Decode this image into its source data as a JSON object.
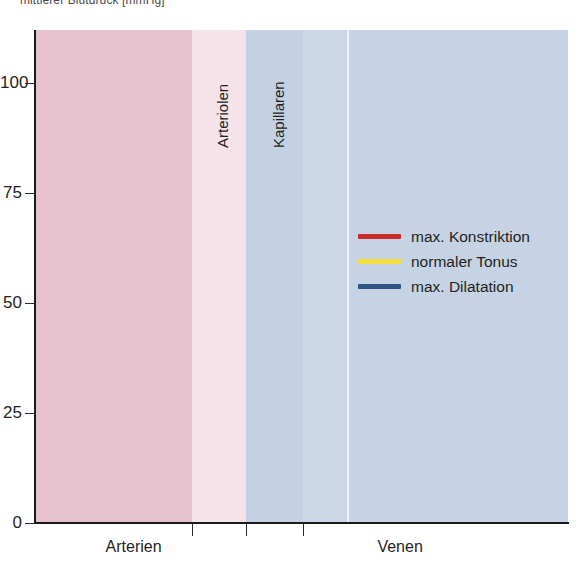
{
  "title": "mittlerer Blutdruck [mmHg]",
  "axes": {
    "y_ticks": [
      {
        "label": "100",
        "value": 100
      },
      {
        "label": "75",
        "value": 75
      },
      {
        "label": "50",
        "value": 50
      },
      {
        "label": "25",
        "value": 25
      },
      {
        "label": "0",
        "value": 0
      }
    ],
    "x_section_labels": [
      {
        "label": "Arterien",
        "x_frac": 0.185
      },
      {
        "label": "Venen",
        "x_frac": 0.685
      }
    ],
    "x_tick_fracs": [
      0.295,
      0.396,
      0.503
    ]
  },
  "vertical_band_labels": [
    {
      "label": "Arteriolen",
      "x_frac": 0.325
    },
    {
      "label": "Kapillaren",
      "x_frac": 0.43
    }
  ],
  "legend": {
    "items": [
      {
        "label": "max. Konstriktion",
        "color": "#cc2c28"
      },
      {
        "label": "normaler Tonus",
        "color": "#f7e03c"
      },
      {
        "label": "max. Dilatation",
        "color": "#2d5480"
      }
    ]
  },
  "colors": {
    "band_arteries": "#e6c2ce",
    "band_arterioles": "#f6e3e9",
    "band_capillaries": "#c3d1e3",
    "band_veins": "#c6d3e5",
    "band_veins_light": "#cbd7e7",
    "axis": "#1a1a1a",
    "text": "#231f20",
    "red": "#cc2c28",
    "yellow": "#f7e03c",
    "blue": "#2d5480"
  },
  "chart_data": {
    "type": "line",
    "title": "mittlerer Blutdruck [mmHg]",
    "xlabel": "",
    "ylabel": "mittlerer Blutdruck [mmHg]",
    "ylim": [
      0,
      112
    ],
    "xlim": [
      0,
      1
    ],
    "grid": false,
    "legend_position": "center-right",
    "x_categories": [
      "Arterien",
      "Arteriolen",
      "Kapillaren",
      "Venen"
    ],
    "band_regions": [
      {
        "name": "Arterien",
        "x_start": 0.0,
        "x_end": 0.295,
        "color": "#e6c2ce"
      },
      {
        "name": "Arteriolen",
        "x_start": 0.295,
        "x_end": 0.396,
        "color": "#f6e3e9"
      },
      {
        "name": "Kapillaren",
        "x_start": 0.396,
        "x_end": 0.503,
        "color": "#c3d1e3"
      },
      {
        "name": "Venen",
        "x_start": 0.503,
        "x_end": 1.0,
        "color": "#c6d3e5"
      }
    ],
    "series": [
      {
        "name": "max. Konstriktion",
        "color": "#cc2c28",
        "x": [
          0.0,
          0.05,
          0.1,
          0.15,
          0.2,
          0.25,
          0.28,
          0.3,
          0.32,
          0.33,
          0.335,
          0.34,
          0.345,
          0.35,
          0.36,
          0.38,
          0.4,
          0.43,
          0.46,
          0.5,
          0.55,
          0.6,
          0.65,
          0.7,
          0.78,
          0.86,
          0.93,
          1.0
        ],
        "y": [
          100,
          99.5,
          98.5,
          97,
          94.5,
          90,
          86,
          82,
          74,
          66,
          58,
          48,
          38,
          30,
          22,
          16,
          13.5,
          12.5,
          12,
          11,
          9,
          7.2,
          5.6,
          4.2,
          2.4,
          1.2,
          0.5,
          0.2
        ]
      },
      {
        "name": "normaler Tonus",
        "color": "#f7e03c",
        "x": [
          0.0,
          0.05,
          0.1,
          0.15,
          0.2,
          0.25,
          0.28,
          0.3,
          0.32,
          0.34,
          0.36,
          0.38,
          0.4,
          0.42,
          0.44,
          0.47,
          0.5,
          0.55,
          0.6,
          0.65,
          0.7,
          0.78,
          0.86,
          0.93,
          1.0
        ],
        "y": [
          100,
          99,
          97.5,
          95,
          91.5,
          86,
          81,
          76,
          68,
          57,
          46,
          37,
          30,
          26,
          23,
          20,
          18,
          15,
          12.5,
          10.2,
          8.2,
          5.2,
          2.8,
          1.1,
          0.3
        ]
      },
      {
        "name": "max. Dilatation",
        "color": "#2d5480",
        "x": [
          0.0,
          0.05,
          0.1,
          0.15,
          0.2,
          0.25,
          0.3,
          0.33,
          0.36,
          0.4,
          0.44,
          0.48,
          0.52,
          0.56,
          0.6,
          0.65,
          0.7,
          0.76,
          0.82,
          0.88,
          0.94,
          1.0
        ],
        "y": [
          100,
          97.5,
          94,
          89.5,
          84,
          77.5,
          70,
          65,
          59.5,
          52,
          44.5,
          38,
          32,
          27,
          23,
          18.5,
          14.8,
          10.8,
          7.4,
          4.5,
          2.2,
          0.5
        ]
      }
    ]
  }
}
